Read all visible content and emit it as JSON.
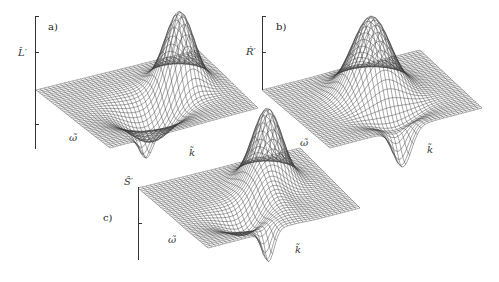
{
  "figure": {
    "panels": [
      {
        "id": "a",
        "tag": "a)",
        "zlabel": "L̂′",
        "xlabel": "ω̃",
        "ylabel": "k̃",
        "shape": "peak-with-trough"
      },
      {
        "id": "b",
        "tag": "b)",
        "zlabel": "Ṙ′",
        "xlabel": "ω̃",
        "ylabel": "k̃",
        "shape": "central-peak-with-front-dip"
      },
      {
        "id": "c",
        "tag": "c)",
        "zlabel": "Ŝ′",
        "xlabel": "ω̃",
        "ylabel": "k̃",
        "shape": "ridge-peak-with-front-dip"
      }
    ]
  },
  "style": {
    "line_color": "#3a3a3a",
    "axis_color": "#333333"
  }
}
